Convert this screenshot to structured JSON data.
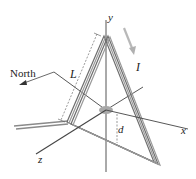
{
  "figure": {
    "labels": {
      "north": "North",
      "y_axis": "y",
      "x_axis": "x",
      "z_axis": "z",
      "side_length": "L",
      "current": "I",
      "distance": "d"
    },
    "colors": {
      "wire": "#8a8a8a",
      "wire_dark": "#5a5a5a",
      "axis": "#444444",
      "current_arrow": "#b0b0b0",
      "hub": "#a8a8a8",
      "background": "#ffffff"
    }
  }
}
